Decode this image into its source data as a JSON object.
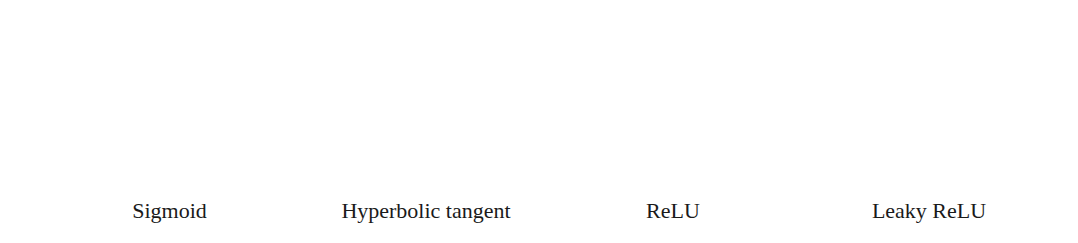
{
  "chart_data": [
    {
      "type": "line",
      "title": "Sigmoid",
      "xlabel": "",
      "ylabel": "",
      "xlim": [
        -5,
        5
      ],
      "ylim": [
        0,
        1
      ],
      "xticks": [
        "-5",
        "-2.5",
        "0",
        "2.5",
        "5"
      ],
      "yticks": [
        "0",
        "0.2",
        "0.4",
        "0.6",
        "0.8",
        "1"
      ],
      "grid": false,
      "function": "1/(1+exp(-x))",
      "series": [
        {
          "name": "sigmoid",
          "x": [
            -5,
            -4,
            -3,
            -2.5,
            -2,
            -1,
            0,
            1,
            2,
            2.5,
            3,
            4,
            5
          ],
          "y": [
            0.007,
            0.018,
            0.047,
            0.076,
            0.119,
            0.269,
            0.5,
            0.731,
            0.881,
            0.924,
            0.953,
            0.982,
            0.993
          ]
        }
      ]
    },
    {
      "type": "line",
      "title": "Hyperbolic tangent",
      "xlabel": "",
      "ylabel": "",
      "xlim": [
        -5,
        5
      ],
      "ylim": [
        -1,
        1
      ],
      "xticks": [
        "-5",
        "-2.5",
        "0",
        "2.5",
        "5"
      ],
      "yticks": [
        "-1",
        "-0.5",
        "0",
        "0.5",
        "1"
      ],
      "grid": false,
      "function": "tanh(x)",
      "series": [
        {
          "name": "tanh",
          "x": [
            -5,
            -3,
            -2.5,
            -2,
            -1,
            -0.5,
            0,
            0.5,
            1,
            2,
            2.5,
            3,
            5
          ],
          "y": [
            -1.0,
            -0.995,
            -0.987,
            -0.964,
            -0.762,
            -0.462,
            0,
            0.462,
            0.762,
            0.964,
            0.987,
            0.995,
            1.0
          ]
        }
      ]
    },
    {
      "type": "line",
      "title": "ReLU",
      "xlabel": "",
      "ylabel": "",
      "xlim": [
        -5,
        5
      ],
      "ylim": [
        0,
        5
      ],
      "xticks": [
        "-5",
        "-2.5",
        "0",
        "2.5",
        "5"
      ],
      "yticks": [
        "0",
        "1",
        "2",
        "3",
        "4",
        "5"
      ],
      "grid": false,
      "function": "max(0,x)",
      "series": [
        {
          "name": "relu",
          "x": [
            -5,
            0,
            5
          ],
          "y": [
            0,
            0,
            5
          ]
        }
      ]
    },
    {
      "type": "line",
      "title": "Leaky ReLU",
      "xlabel": "",
      "ylabel": "",
      "xlim": [
        -5,
        5
      ],
      "ylim": [
        -1,
        5
      ],
      "xticks": [
        "-5",
        "-2.5",
        "0",
        "2.5",
        "5"
      ],
      "yticks": [
        "-1",
        "0",
        "1",
        "2",
        "3",
        "4",
        "5"
      ],
      "grid": false,
      "function": "x>=0 ? x : 0.2x",
      "series": [
        {
          "name": "leaky_relu",
          "x": [
            -5,
            0,
            5
          ],
          "y": [
            -1,
            0,
            5
          ]
        }
      ]
    }
  ],
  "captions": [
    "Sigmoid",
    "Hyperbolic tangent",
    "ReLU",
    "Leaky ReLU"
  ],
  "colors": {
    "line": "#1a1a1a",
    "frame": "#555555",
    "tick_label": "#444444"
  }
}
